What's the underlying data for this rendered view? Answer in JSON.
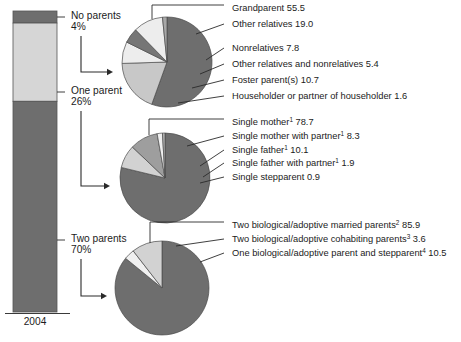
{
  "figure": {
    "axis_label": "2004",
    "background": "#ffffff"
  },
  "colors": {
    "dark_gray": "#6e6e6e",
    "light_gray": "#d6d6d6",
    "mid_gray": "#9e9e9e",
    "pale_gray": "#ebebeb",
    "very_dark_gray": "#636363",
    "outline": "#4a4a4a",
    "text": "#1b1b1b"
  },
  "bar": {
    "name": "living-arrangements-stacked-bar",
    "segments": [
      {
        "label": "No parents",
        "percent_text": "4%",
        "value": 4,
        "color": "#6e6e6e"
      },
      {
        "label": "One parent",
        "percent_text": "26%",
        "value": 26,
        "color": "#d6d6d6"
      },
      {
        "label": "Two parents",
        "percent_text": "70%",
        "value": 70,
        "color": "#6e6e6e"
      }
    ]
  },
  "pies": [
    {
      "name": "no-parents-breakdown-pie",
      "source_segment": "No parents",
      "slices": [
        {
          "label": "Grandparent",
          "value": 55.5,
          "value_text": "55.5",
          "color": "#6e6e6e",
          "sup": ""
        },
        {
          "label": "Other relatives",
          "value": 19.0,
          "value_text": "19.0",
          "color": "#c8c8c8",
          "sup": ""
        },
        {
          "label": "Nonrelatives",
          "value": 7.8,
          "value_text": "7.8",
          "color": "#ededed",
          "sup": ""
        },
        {
          "label": "Other relatives and nonrelatives",
          "value": 5.4,
          "value_text": "5.4",
          "color": "#767676",
          "sup": ""
        },
        {
          "label": "Foster parent(s)",
          "value": 10.7,
          "value_text": "10.7",
          "color": "#ededed",
          "sup": ""
        },
        {
          "label": "Householder or partner of householder",
          "value": 1.6,
          "value_text": "1.6",
          "color": "#a8a8a8",
          "sup": ""
        }
      ]
    },
    {
      "name": "one-parent-breakdown-pie",
      "source_segment": "One parent",
      "slices": [
        {
          "label": "Single mother",
          "value": 78.7,
          "value_text": "78.7",
          "color": "#6e6e6e",
          "sup": "1"
        },
        {
          "label": "Single mother with partner",
          "value": 8.3,
          "value_text": "8.3",
          "color": "#d2d2d2",
          "sup": "1"
        },
        {
          "label": "Single father",
          "value": 10.1,
          "value_text": "10.1",
          "color": "#9e9e9e",
          "sup": "1"
        },
        {
          "label": "Single father with partner",
          "value": 1.9,
          "value_text": "1.9",
          "color": "#efefef",
          "sup": "1"
        },
        {
          "label": "Single stepparent",
          "value": 0.9,
          "value_text": "0.9",
          "color": "#b5b5b5",
          "sup": ""
        }
      ]
    },
    {
      "name": "two-parents-breakdown-pie",
      "source_segment": "Two parents",
      "slices": [
        {
          "label": "Two biological/adoptive married parents",
          "value": 85.9,
          "value_text": "85.9",
          "color": "#6e6e6e",
          "sup": "2"
        },
        {
          "label": "Two biological/adoptive cohabiting parents",
          "value": 3.6,
          "value_text": "3.6",
          "color": "#f0f0f0",
          "sup": "3"
        },
        {
          "label": "One biological/adoptive parent and stepparent",
          "value": 10.5,
          "value_text": "10.5",
          "color": "#d2d2d2",
          "sup": "4"
        }
      ]
    }
  ],
  "chart_data": {
    "type": "pie",
    "title": "",
    "xlabel": "2004",
    "ylabel": "",
    "stacked_bar": {
      "type": "bar",
      "categories": [
        "No parents",
        "One parent",
        "Two parents"
      ],
      "values": [
        4,
        26,
        70
      ],
      "units": "percent"
    },
    "charts": [
      {
        "type": "pie",
        "title": "No parents",
        "categories": [
          "Grandparent",
          "Other relatives",
          "Nonrelatives",
          "Other relatives and nonrelatives",
          "Foster parent(s)",
          "Householder or partner of householder"
        ],
        "values": [
          55.5,
          19.0,
          7.8,
          5.4,
          10.7,
          1.6
        ]
      },
      {
        "type": "pie",
        "title": "One parent",
        "categories": [
          "Single mother",
          "Single mother with partner",
          "Single father",
          "Single father with partner",
          "Single stepparent"
        ],
        "values": [
          78.7,
          8.3,
          10.1,
          1.9,
          0.9
        ]
      },
      {
        "type": "pie",
        "title": "Two parents",
        "categories": [
          "Two biological/adoptive married parents",
          "Two biological/adoptive cohabiting parents",
          "One biological/adoptive parent and stepparent"
        ],
        "values": [
          85.9,
          3.6,
          10.5
        ]
      }
    ]
  }
}
